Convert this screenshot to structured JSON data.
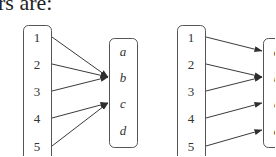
{
  "caption": "rs are:",
  "diagrams": [
    {
      "name": "mapping-1",
      "domain": [
        "1",
        "2",
        "3",
        "4",
        "5"
      ],
      "codomain": [
        "a",
        "b",
        "c",
        "d"
      ],
      "arrows": [
        [
          "1",
          "b"
        ],
        [
          "2",
          "b"
        ],
        [
          "3",
          "b"
        ],
        [
          "4",
          "c"
        ],
        [
          "5",
          "c"
        ]
      ]
    },
    {
      "name": "mapping-2",
      "domain": [
        "1",
        "2",
        "3",
        "4",
        "5"
      ],
      "codomain": [
        "a",
        "b",
        "c",
        "d"
      ],
      "arrows": [
        [
          "1",
          "a"
        ],
        [
          "2",
          "b"
        ],
        [
          "3",
          "b"
        ],
        [
          "4",
          "c"
        ],
        [
          "5",
          "d"
        ]
      ]
    }
  ],
  "colors": {
    "line": "#3a3a3a",
    "text": "#333333"
  }
}
